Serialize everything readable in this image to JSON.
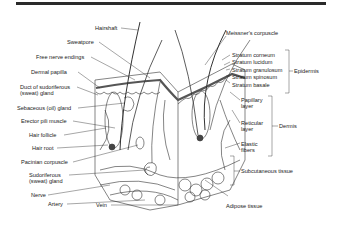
{
  "figure": {
    "title": ""
  },
  "labels_left": {
    "hairshaft": "Hairshaft",
    "sweatpore": "Sweatpore",
    "free_nerve_endings": "Free nerve endings",
    "dermal_papilla": "Dermal papilla",
    "duct_line1": "Duct of sudoriferous",
    "duct_line2": "(sweat) gland",
    "sebaceous": "Sebaceous (oil) gland",
    "erector": "Erector pili muscle",
    "hair_follicle": "Hair follicle",
    "hair_root": "Hair root",
    "pacinian": "Pacinian corpuscle",
    "sudoriferous_line1": "Sudoriferous",
    "sudoriferous_line2": "(sweat) gland",
    "nerve": "Nerve",
    "artery": "Artery",
    "vein": "Vein"
  },
  "labels_right": {
    "meissner": "Meissner's corpuscle",
    "stratum_corneum": "Stratum corneum",
    "stratum_lucidum": "Stratum lucidum",
    "stratum_granulosum": "Stratum granulosum",
    "stratum_spinosum": "Stratum spinosum",
    "stratum_basale": "Stratum basale",
    "papillary_line1": "Papillary",
    "papillary_line2": "layer",
    "reticular_line1": "Reticular",
    "reticular_line2": "layer",
    "elastic_line1": "Elastic",
    "elastic_line2": "fibers",
    "adipose": "Adipose tissue"
  },
  "groups": {
    "epidermis": "Epidermis",
    "dermis": "Dermis",
    "subcutaneous": "Subcutaneous tissue"
  }
}
